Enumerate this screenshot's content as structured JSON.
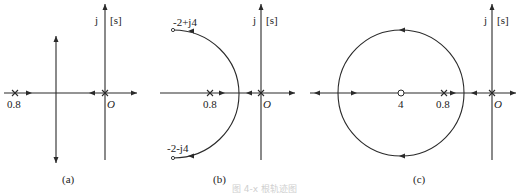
{
  "figure": {
    "caption": "图 4-x 根轨迹图",
    "panels": [
      {
        "id": "a",
        "label": "(a)",
        "axis_label_j": "j",
        "axis_label_plane": "[s]",
        "origin_label": "O",
        "pole_labels": [
          "0.8"
        ],
        "description": "Two real poles (at origin and -0.8) breaking away onto a vertical asymptote"
      },
      {
        "id": "b",
        "label": "(b)",
        "axis_label_j": "j",
        "axis_label_plane": "[s]",
        "origin_label": "O",
        "pole_labels": [
          "0.8"
        ],
        "complex_labels": [
          "-2+j4",
          "-2-j4"
        ],
        "description": "Two real poles meeting and departing along an arc ending at -2±j4"
      },
      {
        "id": "c",
        "label": "(c)",
        "axis_label_j": "j",
        "axis_label_plane": "[s]",
        "origin_label": "O",
        "pole_labels": [
          "0.8"
        ],
        "zero_labels": [
          "4"
        ],
        "description": "Root locus forming a circle centered at zero -4"
      }
    ]
  }
}
